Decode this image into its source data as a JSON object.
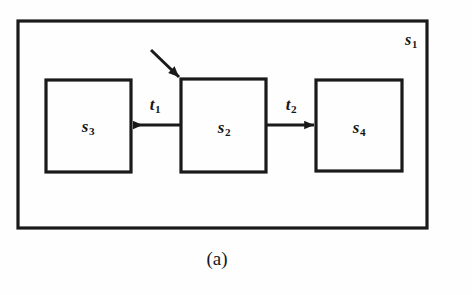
{
  "figure": {
    "caption": "(a)",
    "stroke_color": "#1a1a1a",
    "background_color": "#fefefe"
  },
  "diagram": {
    "type": "state-machine-block-diagram",
    "outer_state": {
      "name": "outer-state",
      "label_base": "s",
      "label_sub": "1",
      "label_full": "s1",
      "x": 18,
      "y": 21,
      "width": 409,
      "height": 207,
      "label_x": 411,
      "label_y": 40
    },
    "nodes": [
      {
        "name": "state-s3",
        "label_base": "s",
        "label_sub": "3",
        "label_full": "s3",
        "x": 46,
        "y": 80,
        "width": 85,
        "height": 92,
        "label_x": 88,
        "label_y": 126
      },
      {
        "name": "state-s2",
        "label_base": "s",
        "label_sub": "2",
        "label_full": "s2",
        "x": 181,
        "y": 79,
        "width": 85,
        "height": 93,
        "label_x": 224,
        "label_y": 127
      },
      {
        "name": "state-s4",
        "label_base": "s",
        "label_sub": "4",
        "label_full": "s4",
        "x": 316,
        "y": 80,
        "width": 86,
        "height": 91,
        "label_x": 359,
        "label_y": 127
      }
    ],
    "transitions": [
      {
        "name": "transition-t1",
        "label_base": "t",
        "label_sub": "1",
        "label_full": "t1",
        "from": "state-s2",
        "to": "state-s3",
        "direction": "left",
        "x1": 181,
        "x2": 131,
        "y": 125,
        "label_x": 155,
        "label_y": 104
      },
      {
        "name": "transition-t2",
        "label_base": "t",
        "label_sub": "2",
        "label_full": "t2",
        "from": "state-s2",
        "to": "state-s4",
        "direction": "right",
        "x1": 266,
        "x2": 316,
        "y": 125,
        "label_x": 291,
        "label_y": 104
      }
    ],
    "entry_arrow": {
      "name": "entry-arrow",
      "from_x": 151,
      "from_y": 50,
      "to_x": 181,
      "to_y": 79,
      "target": "state-s2"
    }
  }
}
